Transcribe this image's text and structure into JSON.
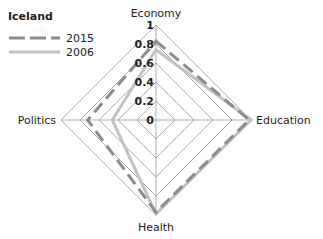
{
  "chart_data": {
    "type": "radar",
    "title": "Iceland",
    "axes": [
      "Economy",
      "Education",
      "Health",
      "Politics"
    ],
    "series": [
      {
        "name": "2015",
        "values": [
          0.83,
          0.98,
          0.97,
          0.72
        ],
        "color": "#8c8c8c",
        "style": "dashed"
      },
      {
        "name": "2006",
        "values": [
          0.74,
          1.0,
          0.99,
          0.46
        ],
        "color": "#c2c2c2",
        "style": "solid"
      }
    ],
    "radial_ticks": [
      "0",
      "0.2",
      "0.4",
      "0.6",
      "0.8",
      "1"
    ],
    "range": [
      0,
      1
    ],
    "grid": true,
    "legend_position": "top-left"
  },
  "legend": {
    "title": "Iceland",
    "items": [
      {
        "label": "2015"
      },
      {
        "label": "2006"
      }
    ]
  },
  "colors": {
    "grid": "#9a9a9a",
    "axis": "#9a9a9a",
    "series_2015": "#8c8c8c",
    "series_2006": "#c2c2c2",
    "text": "#222222"
  }
}
